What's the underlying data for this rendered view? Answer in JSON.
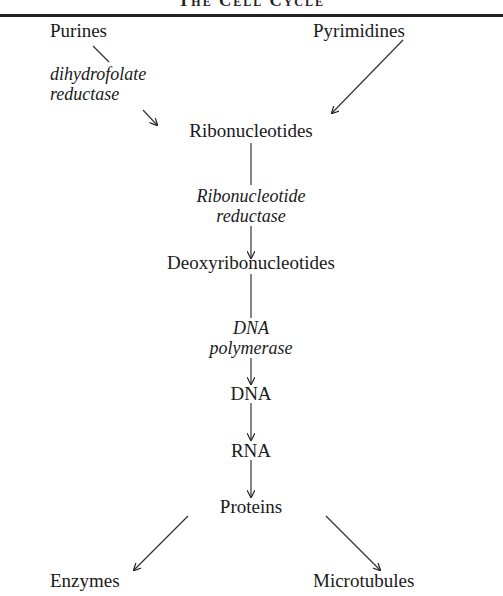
{
  "diagram": {
    "title": "The Cell Cycle",
    "nodes": {
      "purines": "Purines",
      "pyrimidines": "Pyrimidines",
      "ribonucleotides": "Ribonucleotides",
      "deoxyribonucleotides": "Deoxyribonucleotides",
      "dna": "DNA",
      "rna": "RNA",
      "proteins": "Proteins",
      "enzymes": "Enzymes",
      "microtubules": "Microtubules"
    },
    "enzymes": {
      "dhfr_line1": "dihydrofolate",
      "dhfr_line2": "reductase",
      "rnr_line1": "Ribonucleotide",
      "rnr_line2": "reductase",
      "pol_line1": "DNA",
      "pol_line2": "polymerase"
    },
    "edges": [
      {
        "from": "Purines",
        "to": "Ribonucleotides",
        "label": "dihydrofolate reductase"
      },
      {
        "from": "Pyrimidines",
        "to": "Ribonucleotides"
      },
      {
        "from": "Ribonucleotides",
        "to": "Deoxyribonucleotides",
        "label": "Ribonucleotide reductase"
      },
      {
        "from": "Deoxyribonucleotides",
        "to": "DNA",
        "label": "DNA polymerase"
      },
      {
        "from": "DNA",
        "to": "RNA"
      },
      {
        "from": "RNA",
        "to": "Proteins"
      },
      {
        "from": "Proteins",
        "to": "Enzymes"
      },
      {
        "from": "Proteins",
        "to": "Microtubules"
      }
    ]
  }
}
